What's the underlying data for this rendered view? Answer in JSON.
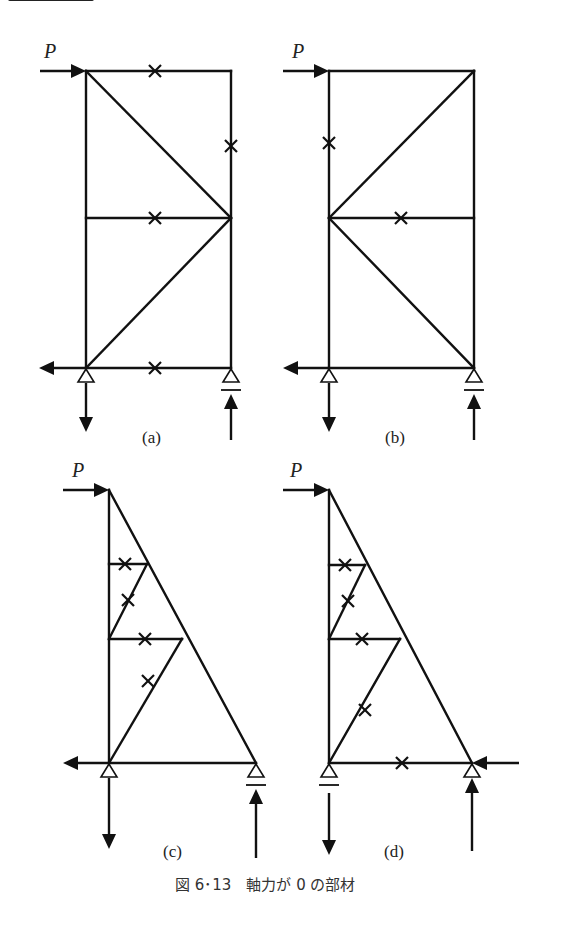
{
  "figure": {
    "caption": "図 6･13　軸力が 0 の部材",
    "load_label": "P"
  },
  "panels": [
    {
      "id": "a",
      "label": "(a)",
      "zero_force_member_count": 4
    },
    {
      "id": "b",
      "label": "(b)",
      "zero_force_member_count": 2
    },
    {
      "id": "c",
      "label": "(c)",
      "zero_force_member_count": 4
    },
    {
      "id": "d",
      "label": "(d)",
      "zero_force_member_count": 5
    }
  ],
  "legend": {
    "zero_marker": "×",
    "zero_marker_meaning": "軸力が 0 の部材"
  },
  "colors": {
    "line": "#111111",
    "background": "#ffffff"
  }
}
